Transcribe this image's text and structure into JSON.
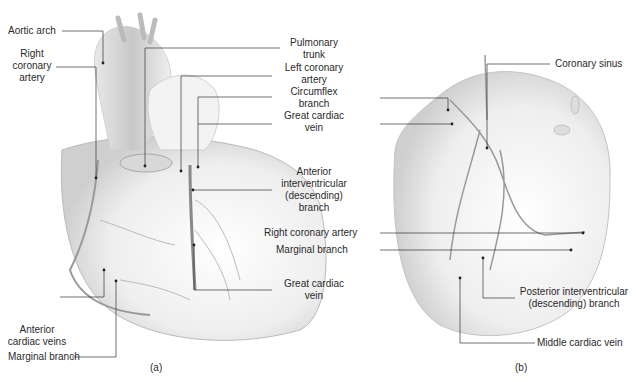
{
  "figure": {
    "panel_a": {
      "caption": "(a)",
      "labels": {
        "aortic_arch": "Aortic arch",
        "right_coronary_artery": [
          "Right",
          "coronary",
          "artery"
        ],
        "pulmonary_trunk": [
          "Pulmonary",
          "trunk"
        ],
        "left_coronary_artery": [
          "Left coronary",
          "artery"
        ],
        "circumflex_branch": [
          "Circumflex",
          "branch"
        ],
        "great_cardiac_vein_top": [
          "Great cardiac",
          "vein"
        ],
        "anterior_interventricular": [
          "Anterior",
          "interventricular",
          "(descending)",
          "branch"
        ],
        "great_cardiac_vein_bottom": [
          "Great cardiac",
          "vein"
        ],
        "anterior_cardiac_veins": [
          "Anterior",
          "cardiac veins"
        ],
        "marginal_branch": "Marginal branch"
      }
    },
    "panel_b": {
      "caption": "(b)",
      "labels": {
        "coronary_sinus": "Coronary sinus",
        "right_coronary_artery": "Right coronary artery",
        "marginal_branch": "Marginal branch",
        "posterior_interventricular": [
          "Posterior interventricular",
          "(descending) branch"
        ],
        "middle_cardiac_vein": "Middle cardiac vein"
      }
    }
  }
}
